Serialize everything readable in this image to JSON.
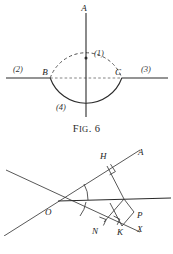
{
  "page": {
    "background_color": "#ffffff",
    "ink_color": "#2b2b2b",
    "width": 173,
    "height": 254
  },
  "figures": [
    {
      "id": "fig6",
      "caption_prefix": "F",
      "caption_smallcaps": "IG",
      "caption_suffix": ". 6",
      "caption_full": "Fig. 6",
      "description": "A circle intersected by a horizontal line; upper arc dashed, lower arc solid, chord BC dashed, vertical diameter through A.",
      "points": [
        {
          "name": "A",
          "label": "A",
          "x": 88,
          "y": 9
        },
        {
          "name": "B",
          "label": "B",
          "x": 50,
          "y": 72
        },
        {
          "name": "C",
          "label": "C",
          "x": 120,
          "y": 72
        }
      ],
      "region_labels": [
        {
          "name": "region-1",
          "label": "(1)",
          "x": 92,
          "y": 53
        },
        {
          "name": "region-2",
          "label": "(2)",
          "x": 19,
          "y": 71
        },
        {
          "name": "region-3",
          "label": "(3)",
          "x": 147,
          "y": 71
        },
        {
          "name": "region-4",
          "label": "(4)",
          "x": 62,
          "y": 107
        }
      ],
      "circle": {
        "cx": 86,
        "cy": 58,
        "r": 38
      },
      "horizontal_line": {
        "x1": 6,
        "y1": 78,
        "x2": 168,
        "y2": 78
      },
      "vertical_line": {
        "x1": 86,
        "y1": 13,
        "x2": 86,
        "y2": 118
      },
      "center_dot": {
        "cx": 86,
        "cy": 58,
        "r": 1.4
      }
    },
    {
      "id": "fig7",
      "caption_prefix": "F",
      "caption_smallcaps": "IG",
      "caption_suffix": ". 7",
      "caption_full": "Fig. 7",
      "description": "Two rays OA and OX from vertex O with an angle bisector; perpendiculars dropped at H, N, K forming right angles, with point P.",
      "points": [
        {
          "name": "A",
          "label": "A",
          "x": 142,
          "y": 17
        },
        {
          "name": "H",
          "label": "H",
          "x": 104,
          "y": 22
        },
        {
          "name": "O",
          "label": "O",
          "x": 49,
          "y": 76
        },
        {
          "name": "P",
          "label": "P",
          "x": 141,
          "y": 80
        },
        {
          "name": "N",
          "label": "N",
          "x": 99,
          "y": 97
        },
        {
          "name": "K",
          "label": "K",
          "x": 121,
          "y": 100
        },
        {
          "name": "X",
          "label": "X",
          "x": 143,
          "y": 98
        }
      ],
      "vertex": {
        "x": 58,
        "y": 66
      },
      "rays": {
        "ray_OA": {
          "x1": 58,
          "y1": 66,
          "x2": 140,
          "y2": 14
        },
        "ray_OX": {
          "x1": 58,
          "y1": 66,
          "x2": 138,
          "y2": 103
        },
        "ray_horizontal": {
          "x1": 58,
          "y1": 66,
          "x2": 170,
          "y2": 64
        },
        "back_upper_left": {
          "x1": 58,
          "y1": 66,
          "x2": 4,
          "y2": 44
        },
        "back_lower_left": {
          "x1": 58,
          "y1": 66,
          "x2": 10,
          "y2": 101
        }
      },
      "angle_arcs": [
        {
          "name": "upper-angle-arc"
        },
        {
          "name": "lower-angle-arc"
        }
      ],
      "right_angles": [
        {
          "name": "right-angle-at-H"
        },
        {
          "name": "right-angle-at-N"
        },
        {
          "name": "right-angle-at-K"
        }
      ]
    }
  ]
}
